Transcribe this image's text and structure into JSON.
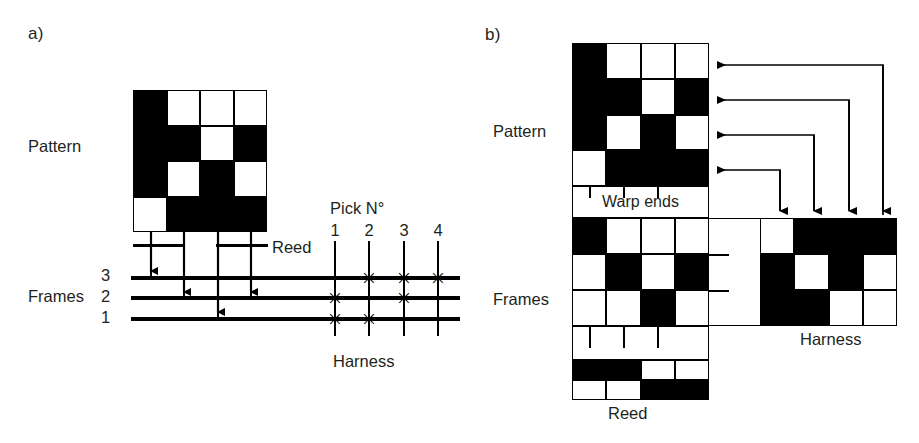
{
  "figure": {
    "panel_a": {
      "letter": "a)",
      "labels": {
        "pattern": "Pattern",
        "reed": "Reed",
        "frames": "Frames",
        "pick_no": "Pick N°",
        "harness": "Harness"
      },
      "pattern_grid": {
        "rows": 4,
        "cols": 4,
        "cells": [
          [
            "b",
            "w",
            "w",
            "w"
          ],
          [
            "b",
            "b",
            "w",
            "b"
          ],
          [
            "b",
            "w",
            "b",
            "w"
          ],
          [
            "w",
            "b",
            "b",
            "b"
          ]
        ]
      },
      "frame_numbers": [
        "3",
        "2",
        "1"
      ],
      "pick_numbers": [
        "1",
        "2",
        "3",
        "4"
      ],
      "warp_to_frame": [
        3,
        2,
        1,
        2
      ],
      "harness_marks": [
        {
          "pick": 1,
          "frames": [
            2,
            1
          ]
        },
        {
          "pick": 2,
          "frames": [
            3,
            1
          ]
        },
        {
          "pick": 3,
          "frames": [
            3,
            2
          ]
        },
        {
          "pick": 4,
          "frames": [
            3
          ]
        }
      ],
      "mark_glyph": "✳"
    },
    "panel_b": {
      "letter": "b)",
      "labels": {
        "pattern": "Pattern",
        "warp_ends": "Warp ends",
        "frames": "Frames",
        "harness": "Harness",
        "reed": "Reed"
      },
      "pattern_grid": {
        "rows": 4,
        "cols": 4,
        "cells": [
          [
            "b",
            "w",
            "w",
            "w"
          ],
          [
            "b",
            "b",
            "w",
            "b"
          ],
          [
            "b",
            "w",
            "b",
            "w"
          ],
          [
            "w",
            "b",
            "b",
            "b"
          ]
        ]
      },
      "frames_grid": {
        "rows": 3,
        "cols": 4,
        "cells": [
          [
            "b",
            "w",
            "w",
            "w"
          ],
          [
            "w",
            "b",
            "w",
            "b"
          ],
          [
            "w",
            "w",
            "b",
            "w"
          ]
        ]
      },
      "harness_grid": {
        "rows": 3,
        "cols": 4,
        "cells": [
          [
            "w",
            "b",
            "b",
            "b"
          ],
          [
            "b",
            "w",
            "b",
            "w"
          ],
          [
            "b",
            "b",
            "w",
            "w"
          ]
        ]
      },
      "reed_grid": {
        "rows": 2,
        "cols": 4,
        "cells": [
          [
            "b",
            "b",
            "w",
            "w"
          ],
          [
            "w",
            "w",
            "b",
            "b"
          ]
        ]
      },
      "connector_count": 4
    }
  },
  "colors": {
    "ink": "#000000",
    "paper": "#ffffff",
    "text": "#231f20"
  }
}
